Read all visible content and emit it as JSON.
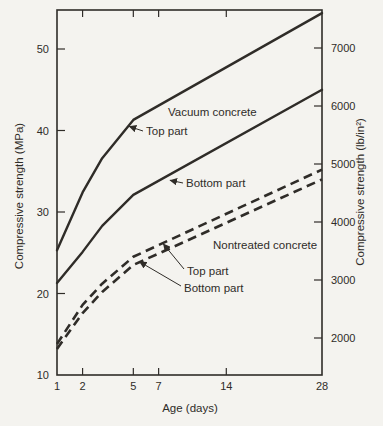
{
  "figure": {
    "background_color": "#f4f3ef",
    "ink_color": "#2f2c28",
    "kind": "scanned textbook line chart, no interactive elements"
  },
  "chart_data": {
    "type": "line",
    "title": "",
    "x_axis": {
      "label": "Age (days)",
      "scale": "sqrt",
      "range": [
        1,
        28
      ],
      "ticks": [
        1,
        2,
        5,
        7,
        14,
        28
      ]
    },
    "y_axis_left": {
      "label": "Compressive strength (MPa)",
      "range": [
        10,
        54.8
      ],
      "ticks": [
        10,
        20,
        30,
        40,
        50
      ]
    },
    "y_axis_right": {
      "label": "Compressive strength (lb/in²)",
      "range": [
        1360,
        7480
      ],
      "ticks": [
        2000,
        3000,
        4000,
        5000,
        6000,
        7000
      ]
    },
    "grid": false,
    "legend": "inline text annotations with arrows",
    "series": [
      {
        "name": "Vacuum concrete - Top part",
        "slug": "vacuum-top",
        "style": "solid",
        "x": [
          1,
          2,
          3,
          5,
          28
        ],
        "values": [
          25.3,
          32.4,
          36.6,
          41.3,
          54.4
        ]
      },
      {
        "name": "Vacuum concrete - Bottom part",
        "slug": "vacuum-bottom",
        "style": "solid",
        "x": [
          1,
          2,
          3,
          5,
          28
        ],
        "values": [
          21.3,
          25.1,
          28.3,
          32.1,
          45.0
        ]
      },
      {
        "name": "Nontreated concrete - Top part",
        "slug": "nontreated-top",
        "style": "dashed",
        "x": [
          1,
          2,
          3,
          5,
          28
        ],
        "values": [
          13.8,
          18.6,
          21.2,
          24.5,
          35.2
        ]
      },
      {
        "name": "Nontreated concrete - Bottom part",
        "slug": "nontreated-bottom",
        "style": "dashed",
        "x": [
          1,
          2,
          3,
          5,
          28
        ],
        "values": [
          13.2,
          17.6,
          20.2,
          23.5,
          34.0
        ]
      }
    ],
    "annotations": [
      {
        "id": "vacuum-concrete-label",
        "text": "Vacuum concrete",
        "x": 168,
        "y": 112
      },
      {
        "id": "vacuum-top-part-label",
        "text": "Top part",
        "x": 146,
        "y": 131,
        "arrow_to": {
          "series": 0,
          "day": 4.7,
          "value": 40.5
        }
      },
      {
        "id": "vacuum-bottom-part-label",
        "text": "Bottom part",
        "x": 186,
        "y": 183,
        "arrow_to": {
          "series": 1,
          "day": 8.0,
          "value": 33.9
        }
      },
      {
        "id": "nontreated-concrete-label",
        "text": "Nontreated concrete",
        "x": 213,
        "y": 245
      },
      {
        "id": "nontreated-top-part-label",
        "text": "Top part",
        "x": 187,
        "y": 271,
        "arrow_to": {
          "series": 2,
          "day": 7.4,
          "value": 26.1
        }
      },
      {
        "id": "nontreated-bottom-part-label",
        "text": "Bottom part",
        "x": 184,
        "y": 288,
        "arrow_to": {
          "series": 3,
          "day": 5.45,
          "value": 23.9
        }
      }
    ]
  }
}
